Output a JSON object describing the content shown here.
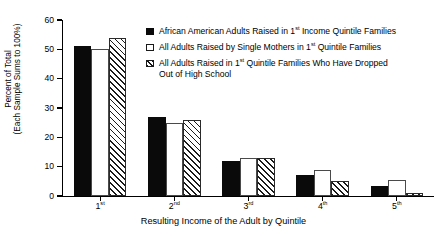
{
  "chart_data": {
    "type": "bar",
    "title": "",
    "xlabel": "Resulting Income of the Adult by Quintile",
    "ylabel_line1": "Percent of Total",
    "ylabel_line2": "(Each Sample Sums to 100%)",
    "ylim": [
      0,
      60
    ],
    "yticks": [
      0,
      10,
      20,
      30,
      40,
      50,
      60
    ],
    "grid": false,
    "legend_position": "upper-right-inside",
    "categories": [
      "1st",
      "2nd",
      "3rd",
      "4th",
      "5th"
    ],
    "category_parts": [
      {
        "num": "1",
        "ord": "st"
      },
      {
        "num": "2",
        "ord": "nd"
      },
      {
        "num": "3",
        "ord": "rd"
      },
      {
        "num": "4",
        "ord": "th"
      },
      {
        "num": "5",
        "ord": "th"
      }
    ],
    "series": [
      {
        "name": "African American Adults Raised in 1st Income Quintile Families",
        "style": "solid",
        "values": [
          51,
          27,
          12,
          7,
          3.5
        ]
      },
      {
        "name": "All Adults Raised by Single Mothers in 1st Quintile Families",
        "style": "open",
        "values": [
          50,
          25,
          13,
          9,
          5.5
        ]
      },
      {
        "name": "All Adults Raised in 1st Quintile Families Who Have Dropped Out of High School",
        "style": "hatch",
        "values": [
          54,
          26,
          13,
          5,
          1
        ]
      }
    ]
  },
  "legend": {
    "items": [
      {
        "style": "solid",
        "pre": "African American Adults Raised in 1",
        "ord": "st",
        "post": " Income Quintile Families",
        "cont": ""
      },
      {
        "style": "open",
        "pre": "All Adults Raised by Single Mothers in 1",
        "ord": "st",
        "post": " Quintile Families",
        "cont": ""
      },
      {
        "style": "hatch",
        "pre": "All Adults Raised in 1",
        "ord": "st",
        "post": " Quintile Families Who Have Dropped",
        "cont": "Out of High School"
      }
    ]
  },
  "axis": {
    "y_tick_labels": [
      "0",
      "10",
      "20",
      "30",
      "40",
      "50",
      "60"
    ],
    "x_title": "Resulting Income of the Adult by Quintile",
    "y_title_line1": "Percent of Total",
    "y_title_line2": "(Each Sample Sums to 100%)"
  }
}
